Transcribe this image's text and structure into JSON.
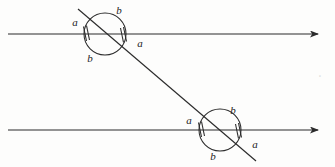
{
  "figure": {
    "background_color": "#fdfdfc",
    "stroke_color": "#2b2b2b",
    "label_color": "#1c1c1c",
    "width": 335,
    "height": 167
  },
  "lines": {
    "parallel_top": {
      "x1": 8,
      "y1": 34,
      "x2": 318,
      "y2": 34,
      "arrow": "right"
    },
    "parallel_bottom": {
      "x1": 8,
      "y1": 130,
      "x2": 318,
      "y2": 130,
      "arrow": "right"
    },
    "transversal": {
      "x1": 78,
      "y1": 9,
      "x2": 256,
      "y2": 161,
      "arrow": "none"
    }
  },
  "intersections": [
    {
      "name": "top-intersection",
      "center_x": 105,
      "center_y": 34,
      "radius": 21,
      "tick_marks": 2
    },
    {
      "name": "bottom-intersection",
      "center_x": 220,
      "center_y": 130,
      "radius": 21,
      "tick_marks": 2
    }
  ],
  "labels": {
    "top_left_a": {
      "text": "a",
      "x": 75,
      "y": 22
    },
    "top_upper_b": {
      "text": "b",
      "x": 119,
      "y": 10
    },
    "top_lower_b": {
      "text": "b",
      "x": 90,
      "y": 58
    },
    "top_right_a": {
      "text": "a",
      "x": 140,
      "y": 43
    },
    "bottom_left_a": {
      "text": "a",
      "x": 189,
      "y": 120
    },
    "bottom_upper_b": {
      "text": "b",
      "x": 233,
      "y": 110
    },
    "bottom_lower_b": {
      "text": "b",
      "x": 213,
      "y": 156
    },
    "bottom_right_a": {
      "text": "a",
      "x": 255,
      "y": 144
    }
  },
  "artifact": {
    "text": "˚",
    "x": 320,
    "y": 78
  }
}
